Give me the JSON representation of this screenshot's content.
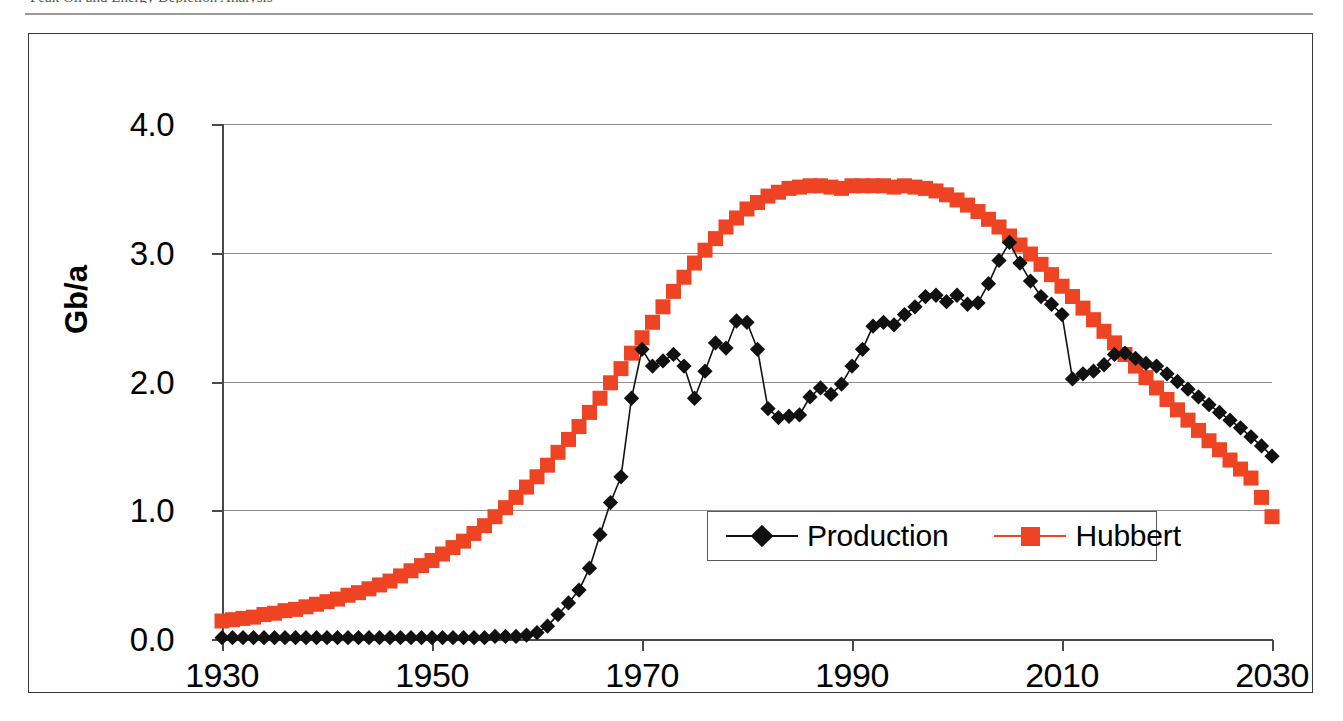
{
  "page": {
    "top_text_sliver": "Peak Oil and Energy Depletion Analysis",
    "background_color": "#ffffff"
  },
  "colors": {
    "production": "#111111",
    "hubbert": "#EE4423",
    "axis": "#4a4a4a",
    "gridline": "#8e8e8e",
    "frame": "#3a3a3a"
  },
  "legend": {
    "position": "inside-lower-right",
    "entries": [
      {
        "label": "Production",
        "marker": "diamond",
        "color": "#111111"
      },
      {
        "label": "Hubbert",
        "marker": "square",
        "color": "#EE4423"
      }
    ]
  },
  "axes": {
    "ylabel": "Gb/a",
    "xlabel": "",
    "yticks": [
      "0.0",
      "1.0",
      "2.0",
      "3.0",
      "4.0"
    ],
    "xticks": [
      "1930",
      "1950",
      "1970",
      "1990",
      "2010",
      "2030"
    ],
    "ylim": [
      0.0,
      4.0
    ],
    "xlim": [
      1930,
      2030
    ],
    "grid": "horizontal"
  },
  "chart_data": {
    "type": "line",
    "title": "",
    "subtitle": "",
    "xlabel": "",
    "ylabel": "Gb/a",
    "xlim": [
      1930,
      2030
    ],
    "ylim": [
      0.0,
      4.0
    ],
    "grid": true,
    "legend_position": "inside-lower-right",
    "x": [
      1930,
      1931,
      1932,
      1933,
      1934,
      1935,
      1936,
      1937,
      1938,
      1939,
      1940,
      1941,
      1942,
      1943,
      1944,
      1945,
      1946,
      1947,
      1948,
      1949,
      1950,
      1951,
      1952,
      1953,
      1954,
      1955,
      1956,
      1957,
      1958,
      1959,
      1960,
      1961,
      1962,
      1963,
      1964,
      1965,
      1966,
      1967,
      1968,
      1969,
      1970,
      1971,
      1972,
      1973,
      1974,
      1975,
      1976,
      1977,
      1978,
      1979,
      1980,
      1981,
      1982,
      1983,
      1984,
      1985,
      1986,
      1987,
      1988,
      1989,
      1990,
      1991,
      1992,
      1993,
      1994,
      1995,
      1996,
      1997,
      1998,
      1999,
      2000,
      2001,
      2002,
      2003,
      2004,
      2005,
      2006,
      2007,
      2008,
      2009,
      2010,
      2011,
      2012,
      2013,
      2014,
      2015,
      2016,
      2017,
      2018,
      2019,
      2020,
      2021,
      2022,
      2023,
      2024,
      2025,
      2026,
      2027,
      2028,
      2029,
      2030
    ],
    "series": [
      {
        "name": "Production",
        "marker": "diamond",
        "color": "#111111",
        "values": [
          0.01,
          0.01,
          0.01,
          0.01,
          0.01,
          0.01,
          0.01,
          0.01,
          0.01,
          0.01,
          0.01,
          0.01,
          0.01,
          0.01,
          0.01,
          0.01,
          0.01,
          0.01,
          0.01,
          0.01,
          0.01,
          0.01,
          0.01,
          0.01,
          0.01,
          0.01,
          0.02,
          0.02,
          0.02,
          0.03,
          0.05,
          0.1,
          0.19,
          0.28,
          0.38,
          0.55,
          0.81,
          1.06,
          1.26,
          1.87,
          2.25,
          2.12,
          2.16,
          2.21,
          2.12,
          1.87,
          2.08,
          2.3,
          2.26,
          2.47,
          2.46,
          2.25,
          1.79,
          1.72,
          1.73,
          1.74,
          1.88,
          1.95,
          1.9,
          1.98,
          2.12,
          2.25,
          2.43,
          2.46,
          2.44,
          2.52,
          2.58,
          2.66,
          2.67,
          2.62,
          2.67,
          2.6,
          2.61,
          2.76,
          2.94,
          3.08,
          2.92,
          2.78,
          2.66,
          2.6,
          2.52,
          2.02,
          2.06,
          2.08,
          2.13,
          2.21,
          2.22,
          2.18,
          2.14,
          2.12,
          2.06,
          2.0,
          1.94,
          1.88,
          1.82,
          1.76,
          1.7,
          1.64,
          1.57,
          1.5,
          1.42
        ]
      },
      {
        "name": "Hubbert",
        "marker": "square",
        "color": "#EE4423",
        "values": [
          0.14,
          0.15,
          0.16,
          0.17,
          0.19,
          0.2,
          0.22,
          0.23,
          0.25,
          0.27,
          0.29,
          0.31,
          0.34,
          0.36,
          0.39,
          0.42,
          0.45,
          0.49,
          0.53,
          0.57,
          0.61,
          0.66,
          0.71,
          0.76,
          0.82,
          0.88,
          0.95,
          1.02,
          1.1,
          1.18,
          1.26,
          1.35,
          1.45,
          1.55,
          1.65,
          1.76,
          1.87,
          1.99,
          2.1,
          2.22,
          2.34,
          2.46,
          2.58,
          2.7,
          2.81,
          2.92,
          3.02,
          3.11,
          3.2,
          3.27,
          3.34,
          3.39,
          3.44,
          3.47,
          3.5,
          3.51,
          3.52,
          3.52,
          3.51,
          3.5,
          3.52,
          3.52,
          3.52,
          3.52,
          3.51,
          3.52,
          3.51,
          3.5,
          3.48,
          3.45,
          3.41,
          3.37,
          3.32,
          3.26,
          3.2,
          3.13,
          3.06,
          2.99,
          2.91,
          2.83,
          2.74,
          2.66,
          2.57,
          2.48,
          2.39,
          2.3,
          2.21,
          2.12,
          2.03,
          1.95,
          1.86,
          1.78,
          1.7,
          1.62,
          1.54,
          1.47,
          1.39,
          1.32,
          1.25,
          1.1,
          0.95
        ]
      }
    ]
  }
}
